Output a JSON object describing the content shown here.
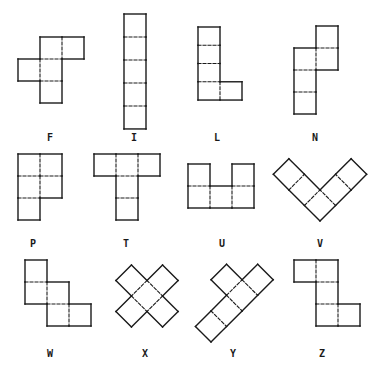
{
  "figure": {
    "cell_size": 22,
    "stroke_color": "#1a1a1a",
    "pentominoes": [
      {
        "name": "F",
        "label": "F",
        "label_pos": [
          50,
          133
        ],
        "x": 18,
        "y": 37,
        "rotate": 0,
        "cells": [
          [
            1,
            0
          ],
          [
            2,
            0
          ],
          [
            0,
            1
          ],
          [
            1,
            1
          ],
          [
            1,
            2
          ]
        ]
      },
      {
        "name": "I",
        "label": "I",
        "label_pos": [
          134,
          133
        ],
        "x": 124,
        "y": 14,
        "rotate": 0,
        "scale_y": 1.045,
        "cells": [
          [
            0,
            0
          ],
          [
            0,
            1
          ],
          [
            0,
            2
          ],
          [
            0,
            3
          ],
          [
            0,
            4
          ]
        ]
      },
      {
        "name": "L",
        "label": "L",
        "label_pos": [
          217,
          133
        ],
        "x": 198,
        "y": 27,
        "rotate": 0,
        "scale_y": 0.83,
        "cells": [
          [
            0,
            0
          ],
          [
            0,
            1
          ],
          [
            0,
            2
          ],
          [
            0,
            3
          ],
          [
            1,
            3
          ]
        ]
      },
      {
        "name": "N",
        "label": "N",
        "label_pos": [
          315,
          133
        ],
        "x": 294,
        "y": 26,
        "rotate": 0,
        "cells": [
          [
            1,
            0
          ],
          [
            0,
            1
          ],
          [
            1,
            1
          ],
          [
            0,
            2
          ],
          [
            0,
            3
          ]
        ]
      },
      {
        "name": "P",
        "label": "P",
        "label_pos": [
          33,
          239
        ],
        "x": 18,
        "y": 154,
        "rotate": 0,
        "cells": [
          [
            0,
            0
          ],
          [
            1,
            0
          ],
          [
            0,
            1
          ],
          [
            1,
            1
          ],
          [
            0,
            2
          ]
        ]
      },
      {
        "name": "T",
        "label": "T",
        "label_pos": [
          126,
          239
        ],
        "x": 94,
        "y": 154,
        "rotate": 0,
        "cells": [
          [
            0,
            0
          ],
          [
            1,
            0
          ],
          [
            2,
            0
          ],
          [
            1,
            1
          ],
          [
            1,
            2
          ]
        ]
      },
      {
        "name": "U",
        "label": "U",
        "label_pos": [
          222,
          239
        ],
        "x": 188,
        "y": 164,
        "rotate": 0,
        "cells": [
          [
            0,
            0
          ],
          [
            2,
            0
          ],
          [
            0,
            1
          ],
          [
            1,
            1
          ],
          [
            2,
            1
          ]
        ]
      },
      {
        "name": "V",
        "label": "V",
        "label_pos": [
          320,
          239
        ],
        "x": 320,
        "y": 221,
        "rotate": -135,
        "cells": [
          [
            0,
            0
          ],
          [
            1,
            0
          ],
          [
            2,
            0
          ],
          [
            0,
            1
          ],
          [
            0,
            2
          ]
        ]
      },
      {
        "name": "W",
        "label": "W",
        "label_pos": [
          50,
          349
        ],
        "x": 25,
        "y": 260,
        "rotate": 0,
        "cells": [
          [
            0,
            0
          ],
          [
            0,
            1
          ],
          [
            1,
            1
          ],
          [
            1,
            2
          ],
          [
            2,
            2
          ]
        ]
      },
      {
        "name": "X",
        "label": "X",
        "label_pos": [
          145,
          349
        ],
        "x": 147,
        "y": 296,
        "rotate": 45,
        "origin_offset": [
          -1.5,
          -1.5
        ],
        "cells": [
          [
            1,
            0
          ],
          [
            0,
            1
          ],
          [
            1,
            1
          ],
          [
            2,
            1
          ],
          [
            1,
            2
          ]
        ]
      },
      {
        "name": "Y",
        "label": "Y",
        "label_pos": [
          233,
          349
        ],
        "x": 211,
        "y": 342,
        "rotate": -45,
        "origin_offset": [
          0,
          -2
        ],
        "cells": [
          [
            2,
            0
          ],
          [
            0,
            1
          ],
          [
            1,
            1
          ],
          [
            2,
            1
          ],
          [
            3,
            1
          ]
        ]
      },
      {
        "name": "Z",
        "label": "Z",
        "label_pos": [
          322,
          349
        ],
        "x": 294,
        "y": 260,
        "rotate": 0,
        "cells": [
          [
            0,
            0
          ],
          [
            1,
            0
          ],
          [
            1,
            1
          ],
          [
            1,
            2
          ],
          [
            2,
            2
          ]
        ]
      }
    ]
  }
}
